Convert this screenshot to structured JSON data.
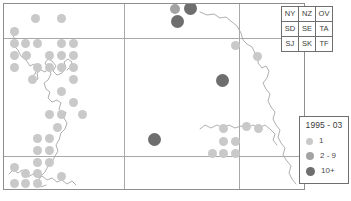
{
  "map": {
    "frame": {
      "x": 3,
      "y": 3,
      "w": 302,
      "h": 187
    },
    "graticule": {
      "vertical_x": [
        123,
        238
      ],
      "horizontal_y": [
        37,
        155
      ],
      "color": "#a8a8a8"
    },
    "colors": {
      "dot_1": "#c9c9c9",
      "dot_2_9": "#a3a3a3",
      "dot_10plus": "#6e6e6e",
      "coastline": "#9a9a9a",
      "frame": "#8e8e8e"
    },
    "records": [
      {
        "x": 34,
        "y": 17,
        "cls": "c1",
        "r": 4.5
      },
      {
        "x": 60,
        "y": 17,
        "cls": "c1",
        "r": 4.5
      },
      {
        "x": 13,
        "y": 30,
        "cls": "c1",
        "r": 4.5
      },
      {
        "x": 13,
        "y": 42,
        "cls": "c1",
        "r": 4.5
      },
      {
        "x": 24,
        "y": 42,
        "cls": "c1",
        "r": 4.5
      },
      {
        "x": 36,
        "y": 42,
        "cls": "c1",
        "r": 4.5
      },
      {
        "x": 60,
        "y": 42,
        "cls": "c1",
        "r": 4.5
      },
      {
        "x": 72,
        "y": 42,
        "cls": "c1",
        "r": 4.5
      },
      {
        "x": 13,
        "y": 54,
        "cls": "c1",
        "r": 4.5
      },
      {
        "x": 25,
        "y": 54,
        "cls": "c1",
        "r": 4.5
      },
      {
        "x": 48,
        "y": 54,
        "cls": "c1",
        "r": 4.5
      },
      {
        "x": 60,
        "y": 54,
        "cls": "c1",
        "r": 4.5
      },
      {
        "x": 72,
        "y": 54,
        "cls": "c1",
        "r": 4.5
      },
      {
        "x": 13,
        "y": 66,
        "cls": "c1",
        "r": 4.5
      },
      {
        "x": 36,
        "y": 66,
        "cls": "c1",
        "r": 4.5
      },
      {
        "x": 48,
        "y": 66,
        "cls": "c1",
        "r": 4.5
      },
      {
        "x": 60,
        "y": 66,
        "cls": "c1",
        "r": 4.5
      },
      {
        "x": 72,
        "y": 66,
        "cls": "c1",
        "r": 4.5
      },
      {
        "x": 31,
        "y": 78,
        "cls": "c1",
        "r": 4.5
      },
      {
        "x": 72,
        "y": 78,
        "cls": "c1",
        "r": 4.5
      },
      {
        "x": 60,
        "y": 90,
        "cls": "c1",
        "r": 4.5
      },
      {
        "x": 72,
        "y": 101,
        "cls": "c1",
        "r": 4.5
      },
      {
        "x": 48,
        "y": 113,
        "cls": "c1",
        "r": 4.5
      },
      {
        "x": 60,
        "y": 113,
        "cls": "c1",
        "r": 4.5
      },
      {
        "x": 81,
        "y": 113,
        "cls": "c1",
        "r": 4.5
      },
      {
        "x": 56,
        "y": 126,
        "cls": "c1",
        "r": 4.5
      },
      {
        "x": 36,
        "y": 137,
        "cls": "c1",
        "r": 4.5
      },
      {
        "x": 48,
        "y": 137,
        "cls": "c1",
        "r": 4.5
      },
      {
        "x": 36,
        "y": 149,
        "cls": "c1",
        "r": 4.5
      },
      {
        "x": 48,
        "y": 149,
        "cls": "c1",
        "r": 4.5
      },
      {
        "x": 36,
        "y": 161,
        "cls": "c1",
        "r": 4.5
      },
      {
        "x": 48,
        "y": 161,
        "cls": "c1",
        "r": 4.5
      },
      {
        "x": 13,
        "y": 166,
        "cls": "c1",
        "r": 4.5
      },
      {
        "x": 24,
        "y": 172,
        "cls": "c1",
        "r": 4.5
      },
      {
        "x": 36,
        "y": 172,
        "cls": "c1",
        "r": 4.5
      },
      {
        "x": 13,
        "y": 182,
        "cls": "c1",
        "r": 4.5
      },
      {
        "x": 24,
        "y": 182,
        "cls": "c1",
        "r": 4.5
      },
      {
        "x": 36,
        "y": 182,
        "cls": "c1",
        "r": 4.5
      },
      {
        "x": 60,
        "y": 175,
        "cls": "c1",
        "r": 4.5
      },
      {
        "x": 234,
        "y": 44,
        "cls": "c1",
        "r": 4.5
      },
      {
        "x": 256,
        "y": 55,
        "cls": "c1",
        "r": 4.5
      },
      {
        "x": 222,
        "y": 127,
        "cls": "c1",
        "r": 4.5
      },
      {
        "x": 245,
        "y": 125,
        "cls": "c1",
        "r": 4.5
      },
      {
        "x": 257,
        "y": 127,
        "cls": "c1",
        "r": 4.5
      },
      {
        "x": 222,
        "y": 140,
        "cls": "c1",
        "r": 4.5
      },
      {
        "x": 234,
        "y": 140,
        "cls": "c1",
        "r": 4.5
      },
      {
        "x": 211,
        "y": 152,
        "cls": "c1",
        "r": 4.5
      },
      {
        "x": 222,
        "y": 152,
        "cls": "c1",
        "r": 4.5
      },
      {
        "x": 234,
        "y": 152,
        "cls": "c1",
        "r": 4.5
      },
      {
        "x": 174,
        "y": 8,
        "cls": "c2",
        "r": 5
      },
      {
        "x": 189,
        "y": 7,
        "cls": "c3",
        "r": 6.5
      },
      {
        "x": 176,
        "y": 20,
        "cls": "c3",
        "r": 6.5
      },
      {
        "x": 221,
        "y": 79,
        "cls": "c3",
        "r": 6.5
      },
      {
        "x": 153,
        "y": 138,
        "cls": "c3",
        "r": 6.5
      }
    ],
    "coastline_paths": [
      "M8,30 L11,35 L9,41 L14,46 L17,52 L22,56 L26,62 L30,60 L33,65 L31,70 L27,73 L30,77 L34,75 L33,69 L37,66 L41,68 L44,64 L41,59 L44,55 L48,57 L52,62 L49,67 L53,71 L58,69 L62,64 L60,58 L64,55 L68,58 L66,63 L63,66",
      "M44,64 L47,70 L44,76 L40,79 L42,85 L46,88 L44,94 L48,98 L53,96 L57,99 L55,105 L58,110 L62,108 L60,114 L63,119 L61,125 L57,129 L55,136 L52,141 L54,147 L51,152 L48,158 L44,162 L41,168 L37,172 L34,178 L37,183 L42,181",
      "M20,168 L24,173 L29,170 L34,174 L38,172 L43,176 L48,174 L53,178 L58,176 L63,180 L68,177 L72,181",
      "M5,170 L9,166 L14,169 L18,166",
      "M196,8 L203,11 L210,10 L216,14 L222,13 L228,18 L233,22 L237,29 L239,36 L243,40 L248,43 L251,49 L255,52 L254,59 L258,64 L262,62 L265,67 L263,74 L259,79 L262,85 L266,90 L264,97 L267,103 L271,108 L269,115 L272,121 L276,126 L274,133 L277,139 L281,144 L279,151 L283,157 L287,162 L285,169 L288,175 L292,180",
      "M196,125 L201,121 L207,124 L213,121 L219,124 L225,121 L231,124 L237,122 L243,124 L249,121 L255,124 L261,121 L266,125 L271,130 L269,136 L273,141"
    ]
  },
  "grid_key": {
    "rows": [
      [
        "NY",
        "NZ",
        "OV"
      ],
      [
        "SD",
        "SE",
        "TA"
      ],
      [
        "SJ",
        "SK",
        "TF"
      ]
    ]
  },
  "legend": {
    "title": "1995 - 03",
    "items": [
      {
        "label": "1",
        "cls": "c1",
        "size": 7,
        "color": "#c9c9c9"
      },
      {
        "label": "2 - 9",
        "cls": "c2",
        "size": 8,
        "color": "#a3a3a3"
      },
      {
        "label": "10+",
        "cls": "c3",
        "size": 9,
        "color": "#6e6e6e"
      }
    ]
  },
  "caption": {
    "text": ""
  }
}
